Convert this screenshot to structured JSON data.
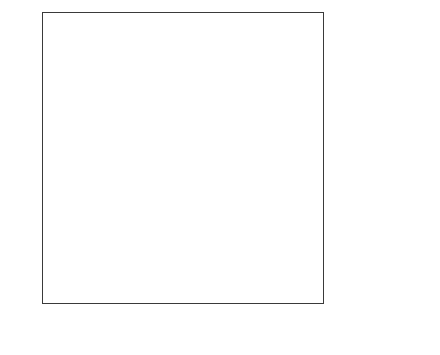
{
  "chart_data": {
    "type": "area",
    "title": "",
    "subtitle": "",
    "xlabel": "",
    "ylabel": "",
    "stacked": true,
    "grid": false,
    "legend_position": "right",
    "x": [
      "1990",
      "2000",
      "2010",
      "2020*",
      "2030*"
    ],
    "x_values": [
      1990,
      2000,
      2010,
      2020,
      2030
    ],
    "xlim": [
      1990,
      2030
    ],
    "ylim": [
      0,
      1000
    ],
    "y_ticks": [
      0,
      100,
      200,
      300,
      400,
      500,
      600,
      700,
      800,
      900,
      1000
    ],
    "y_tick_labels": [
      "0",
      "100",
      "200",
      "300",
      "400",
      "500",
      "600",
      "700",
      "800",
      "900",
      "1,000"
    ],
    "series": [
      {
        "name": "Asia",
        "values": [
          90,
          150,
          215,
          287,
          300
        ],
        "color": "#4a4a4a",
        "label_color": "#ffffff"
      },
      {
        "name": "Europe",
        "values": [
          450,
          390,
          315,
          284,
          274
        ],
        "color": "#ececec",
        "label_color": "#1a1a1a"
      },
      {
        "name": "U.S.",
        "values": [
          225,
          200,
          180,
          146,
          142
        ],
        "color": "#6e6e6e",
        "label_color": "#1a1a1a"
      },
      {
        "name": "Japan",
        "values": [
          105,
          95,
          90,
          78,
          77
        ],
        "color": "#ffffff",
        "label_color": "#1a1a1a"
      },
      {
        "name": "Middle East",
        "values": [
          80,
          85,
          90,
          92,
          93
        ],
        "color": "#969696",
        "label_color": "#1a1a1a"
      },
      {
        "name": "Central & South America",
        "values": [
          33,
          35,
          40,
          47,
          48
        ],
        "color": "#c8c8c8",
        "label_color": "#1a1a1a"
      },
      {
        "name": "Others",
        "values": [
          17,
          45,
          70,
          66,
          66
        ],
        "color": "#8a8a8a",
        "label_color": "#1a1a1a"
      }
    ],
    "cumulative_tops": {
      "Asia": [
        90,
        150,
        215,
        287,
        300
      ],
      "Europe": [
        540,
        540,
        530,
        571,
        574
      ],
      "U.S.": [
        765,
        740,
        710,
        717,
        716
      ],
      "Japan": [
        870,
        835,
        800,
        795,
        793
      ],
      "Middle East": [
        950,
        920,
        890,
        887,
        886
      ],
      "Central & South America": [
        983,
        955,
        930,
        934,
        934
      ],
      "Others": [
        1000,
        1000,
        1000,
        1000,
        1000
      ]
    },
    "in_plot_labels": [
      {
        "name": "Japan",
        "x": 2004,
        "y": 795,
        "on_dark": false
      },
      {
        "name": "U.S.",
        "x": 2011.5,
        "y": 630,
        "on_dark": false
      },
      {
        "name": "Europe",
        "x": 2010,
        "y": 395,
        "on_dark": false
      },
      {
        "name": "Asia",
        "x": 2018,
        "y": 130,
        "on_dark": true
      }
    ],
    "legend_entries": [
      {
        "label": "Others",
        "color": "#8a8a8a"
      },
      {
        "label": "Central & South America",
        "color": "#c8c8c8"
      },
      {
        "label": "Middle East",
        "color": "#969696"
      }
    ],
    "footnote": "(*): Estimation"
  }
}
